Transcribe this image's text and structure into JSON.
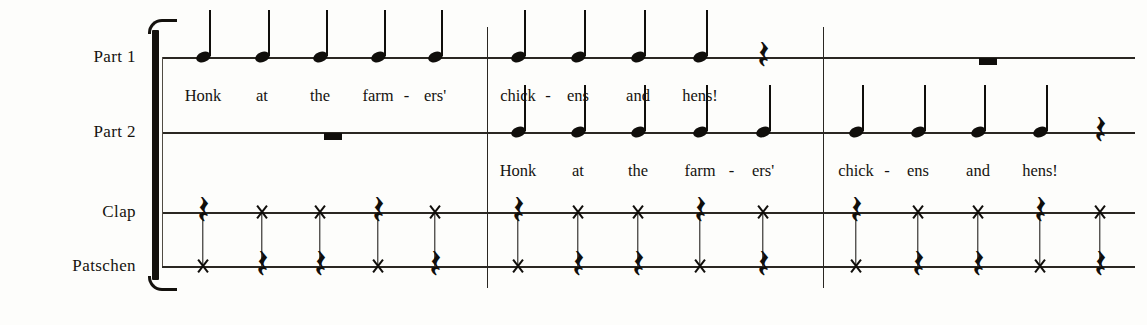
{
  "document": {
    "type": "music-notation",
    "title": "Honk at the farmers' chickens and hens!",
    "staff_count": 4,
    "measure_count": 3,
    "beats_per_measure": 5
  },
  "staves": [
    {
      "id": "part1",
      "label": "Part 1",
      "y": 57
    },
    {
      "id": "part2",
      "label": "Part 2",
      "y": 132
    },
    {
      "id": "clap",
      "label": "Clap",
      "y": 212
    },
    {
      "id": "patschen",
      "label": "Patschen",
      "y": 266
    }
  ],
  "layout": {
    "staff_left": 162,
    "staff_right": 1135,
    "bracket": {
      "x": 146,
      "top": 30,
      "bottom": 280
    },
    "barlines": [
      487,
      823
    ],
    "beat_x": {
      "m1": [
        203,
        262,
        320,
        378,
        435
      ],
      "m2": [
        518,
        578,
        638,
        700,
        763
      ],
      "m3": [
        856,
        918,
        978,
        1040,
        1100
      ]
    }
  },
  "music": {
    "part1": {
      "m1": {
        "events": [
          "note",
          "note",
          "note",
          "note",
          "note"
        ]
      },
      "m2": {
        "events": [
          "note",
          "note",
          "note",
          "note",
          "rest-quarter"
        ]
      },
      "m3": {
        "events": [
          "rest-whole"
        ],
        "rest_x": 988
      }
    },
    "part2": {
      "m1": {
        "events": [
          "rest-whole"
        ],
        "rest_x": 333
      },
      "m2": {
        "events": [
          "note",
          "note",
          "note",
          "note",
          "note"
        ]
      },
      "m3": {
        "events": [
          "note",
          "note",
          "note",
          "note",
          "rest-quarter"
        ]
      }
    },
    "clap": {
      "pattern": [
        "rest-quarter",
        "x",
        "x",
        "rest-quarter",
        "x"
      ],
      "measures": 3
    },
    "patschen": {
      "pattern": [
        "x",
        "rest-quarter",
        "rest-quarter",
        "x",
        "rest-quarter"
      ],
      "measures": 3
    }
  },
  "lyrics": {
    "phrase_a": {
      "syllables": [
        "Honk",
        "at",
        "the",
        "farm",
        "ers'"
      ],
      "hyphen_after": [
        3
      ]
    },
    "phrase_b": {
      "syllables": [
        "chick",
        "ens",
        "and",
        "hens!"
      ],
      "hyphen_after": [
        0
      ]
    },
    "placements": [
      {
        "staff": "part1",
        "measure": "m1",
        "phrase": "phrase_a",
        "y": 86
      },
      {
        "staff": "part1",
        "measure": "m2",
        "phrase": "phrase_b",
        "y": 86
      },
      {
        "staff": "part2",
        "measure": "m2",
        "phrase": "phrase_a",
        "y": 161
      },
      {
        "staff": "part2",
        "measure": "m3",
        "phrase": "phrase_b",
        "y": 161
      }
    ]
  },
  "glyphs": {
    "quarter_rest": "𝄽",
    "quarter_rest_fallback": "⸺"
  },
  "colors": {
    "ink": "#100e0b",
    "staff": "#2a2722",
    "paper": "#fdfdfb"
  }
}
